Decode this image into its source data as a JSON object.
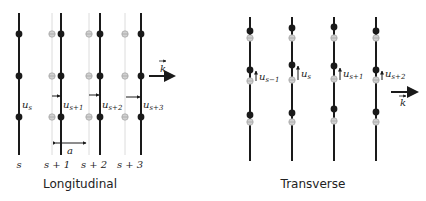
{
  "longitudinal": {
    "caption": "Longitudinal",
    "wave_vector_label": "k",
    "spacing_label": "a",
    "site_labels": [
      "s",
      "s + 1",
      "s + 2",
      "s + 3"
    ],
    "displacement_labels": [
      {
        "base": "u",
        "sub": "s"
      },
      {
        "base": "u",
        "sub": "s+1"
      },
      {
        "base": "u",
        "sub": "s+2"
      },
      {
        "base": "u",
        "sub": "s+3"
      }
    ]
  },
  "transverse": {
    "caption": "Transverse",
    "wave_vector_label": "k",
    "displacement_labels": [
      {
        "base": "u",
        "sub": "s−1"
      },
      {
        "base": "u",
        "sub": "s"
      },
      {
        "base": "u",
        "sub": "s+1"
      },
      {
        "base": "u",
        "sub": "s+2"
      }
    ]
  },
  "colors": {
    "atom": "#1a1a1a",
    "equilibrium": "#a8a8a8",
    "line": "#1a1a1a",
    "ghost_line": "#d8d8d8"
  }
}
